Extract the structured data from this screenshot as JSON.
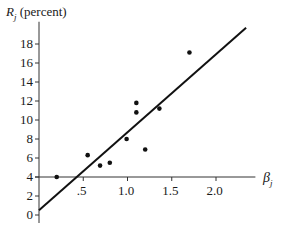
{
  "chart_data": {
    "type": "scatter",
    "title": "",
    "ylabel": "R_j (percent)",
    "ylabel_symbol": "R",
    "ylabel_sub": "j",
    "ylabel_unit": "(percent)",
    "xlabel": "β_j",
    "xlabel_symbol": "β",
    "xlabel_sub": "j",
    "ylim": [
      0,
      19.5
    ],
    "xlim": [
      0,
      2.4
    ],
    "y_ticks": [
      0,
      2,
      4,
      6,
      8,
      10,
      12,
      14,
      16,
      18
    ],
    "y_tick_labels": [
      "0",
      "2",
      "4",
      "6",
      "8",
      "10",
      "12",
      "14",
      "16",
      "18"
    ],
    "x_ticks": [
      0.5,
      1.0,
      1.5,
      2.0
    ],
    "x_tick_labels": [
      ".5",
      "1.0",
      "1.5",
      "2.0"
    ],
    "x_axis_crosses_y_at": 4,
    "grid": false,
    "legend": null,
    "points": [
      {
        "x": 0.2,
        "y": 4.0
      },
      {
        "x": 0.55,
        "y": 6.3
      },
      {
        "x": 0.69,
        "y": 5.2
      },
      {
        "x": 0.8,
        "y": 5.5
      },
      {
        "x": 0.99,
        "y": 8.0
      },
      {
        "x": 1.1,
        "y": 10.8
      },
      {
        "x": 1.1,
        "y": 11.8
      },
      {
        "x": 1.2,
        "y": 6.9
      },
      {
        "x": 1.36,
        "y": 11.2
      },
      {
        "x": 1.7,
        "y": 17.1
      }
    ],
    "fit_line": {
      "x0": 0.0,
      "y0": 0.5,
      "x1": 2.34,
      "y1": 19.7
    }
  }
}
